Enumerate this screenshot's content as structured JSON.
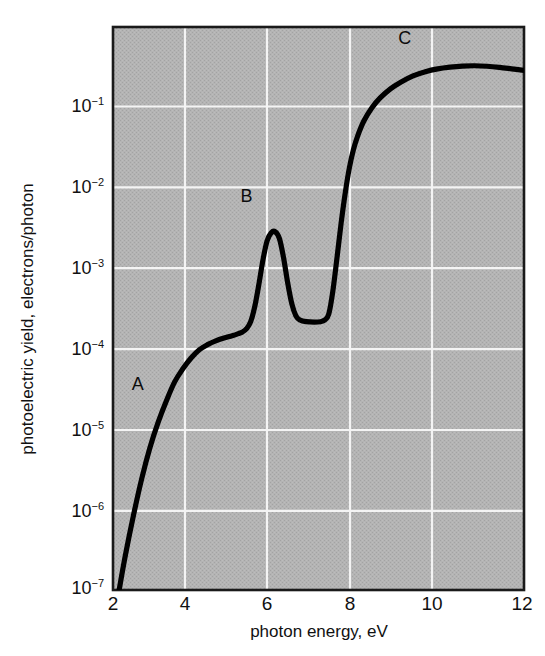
{
  "figure": {
    "background_color": "#ffffff",
    "plot_background_color": "#b2b2b2",
    "grid_color": "#f2f2f2",
    "curve_color": "#000000",
    "frame_color": "#1a1a1a"
  },
  "axes": {
    "x_title": "photon energy, eV",
    "y_title": "photoelectric yield, electrons/photon",
    "x_ticks": [
      "2",
      "4",
      "6",
      "8",
      "10",
      "12"
    ],
    "y_ticks": [
      {
        "mantissa": "10",
        "exponent": "−1"
      },
      {
        "mantissa": "10",
        "exponent": "−2"
      },
      {
        "mantissa": "10",
        "exponent": "−3"
      },
      {
        "mantissa": "10",
        "exponent": "−4"
      },
      {
        "mantissa": "10",
        "exponent": "−5"
      },
      {
        "mantissa": "10",
        "exponent": "−6"
      },
      {
        "mantissa": "10",
        "exponent": "−7"
      }
    ]
  },
  "annotations": [
    {
      "label": "A",
      "x_eV": 2.6,
      "y_yield": 3e-05
    },
    {
      "label": "B",
      "x_eV": 5.25,
      "y_yield": 0.0055
    },
    {
      "label": "C",
      "x_eV": 9.1,
      "y_yield": 0.44
    }
  ],
  "chart_data": {
    "type": "line",
    "title": "",
    "xlabel": "photon energy, eV",
    "ylabel": "photoelectric yield, electrons/photon",
    "xlim": [
      2,
      12
    ],
    "ylim": [
      1e-07,
      0.6
    ],
    "yscale": "log",
    "xscale": "linear",
    "grid": true,
    "legend": "none",
    "series": [
      {
        "name": "photoelectric yield",
        "x": [
          2.15,
          2.3,
          2.5,
          2.7,
          2.9,
          3.1,
          3.3,
          3.5,
          3.7,
          3.9,
          4.1,
          4.3,
          4.5,
          4.7,
          4.9,
          5.05,
          5.15,
          5.25,
          5.35,
          5.45,
          5.55,
          5.65,
          5.75,
          5.85,
          5.95,
          6.05,
          6.15,
          6.25,
          6.35,
          6.45,
          6.55,
          6.7,
          6.9,
          7.05,
          7.15,
          7.25,
          7.35,
          7.45,
          7.55,
          7.65,
          7.75,
          7.85,
          7.95,
          8.1,
          8.3,
          8.5,
          8.75,
          9.0,
          9.3,
          9.6,
          9.9,
          10.2,
          10.5,
          10.8,
          11.1,
          11.4,
          11.7,
          12.0
        ],
        "y": [
          1e-07,
          2.6e-07,
          8e-07,
          2.2e-06,
          5.2e-06,
          1.05e-05,
          1.9e-05,
          3.2e-05,
          4.6e-05,
          6.2e-05,
          7.8e-05,
          9e-05,
          0.0001,
          0.000108,
          0.000115,
          0.000122,
          0.000128,
          0.00014,
          0.00017,
          0.00026,
          0.00048,
          0.00095,
          0.0016,
          0.002,
          0.00205,
          0.0017,
          0.001,
          0.0005,
          0.00028,
          0.0002,
          0.000178,
          0.00017,
          0.000168,
          0.00017,
          0.000178,
          0.00021,
          0.0004,
          0.001,
          0.0026,
          0.006,
          0.012,
          0.02,
          0.029,
          0.044,
          0.064,
          0.084,
          0.108,
          0.13,
          0.155,
          0.174,
          0.188,
          0.197,
          0.203,
          0.205,
          0.202,
          0.196,
          0.188,
          0.18
        ]
      }
    ],
    "features": {
      "threshold_eV": 2.15,
      "plateau_A_yield": 0.00013,
      "peak_B_eV": 5.95,
      "peak_B_yield": 0.00205,
      "valley_after_B_yield": 0.000168,
      "rise_onset_eV": 7.3,
      "maximum_C_eV": 10.8,
      "maximum_C_yield": 0.205
    }
  }
}
